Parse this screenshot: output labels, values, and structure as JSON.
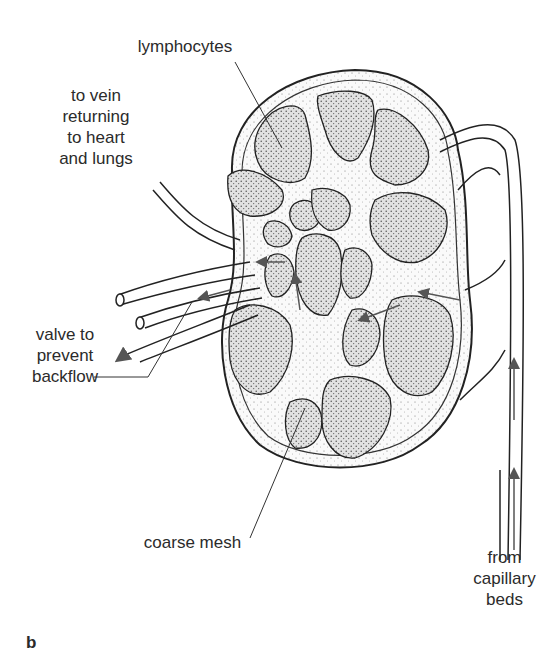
{
  "figure": {
    "panel_letter": "b",
    "labels": {
      "lymphocytes": "lymphocytes",
      "to_vein_1": "to vein",
      "to_vein_2": "returning",
      "to_vein_3": "to heart",
      "to_vein_4": "and lungs",
      "valve_1": "valve to",
      "valve_2": "prevent",
      "valve_3": "backflow",
      "coarse_mesh": "coarse mesh",
      "from_1": "from",
      "from_2": "capillary",
      "from_3": "beds"
    },
    "colors": {
      "ink": "#2a2a2a",
      "stipple_fill": "#d9d9d9",
      "mesh_fill": "#f4f4f4",
      "background": "#ffffff"
    }
  }
}
